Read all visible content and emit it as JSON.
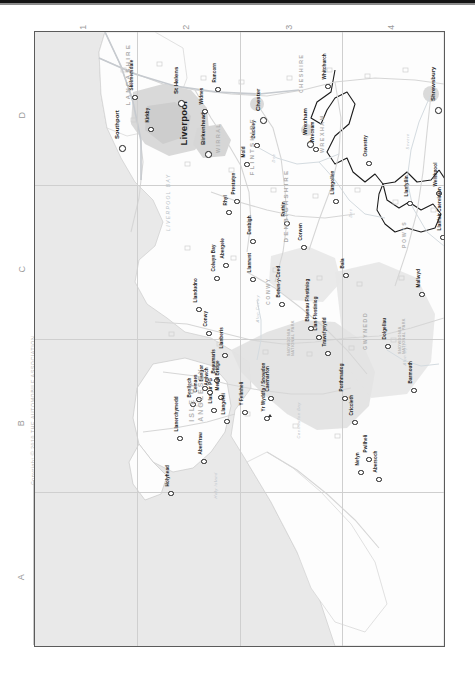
{
  "page": {
    "kind": "road-atlas-page",
    "orientation": "rotated-90-clockwise",
    "copyright": "Copyright © 2010 THE AUTOMOBILE ASSOCIATION",
    "accent_color": "#1d1d1d",
    "sea_color": "#e9e9e9",
    "land_color": "#fdfdfd",
    "county_label_color": "#a9a9a9",
    "water_label_color": "#b9c3c9"
  },
  "grid": {
    "columns": [
      "1",
      "2",
      "3",
      "4"
    ],
    "rows": [
      "D",
      "C",
      "B",
      "A"
    ]
  },
  "cities": [
    {
      "name": "Liverpool",
      "x": 148,
      "y": 108
    }
  ],
  "big_towns": [
    {
      "name": "Southport",
      "x": 82,
      "y": 104
    },
    {
      "name": "St Helens",
      "x": 141,
      "y": 59
    },
    {
      "name": "Birkenhead",
      "x": 168,
      "y": 110
    },
    {
      "name": "Chester",
      "x": 223,
      "y": 76
    },
    {
      "name": "Shrewsbury",
      "x": 398,
      "y": 66
    },
    {
      "name": "Wrexham",
      "x": 270,
      "y": 100
    }
  ],
  "towns": [
    {
      "name": "Skelmersdale",
      "x": 96,
      "y": 56
    },
    {
      "name": "Kirkby",
      "x": 112,
      "y": 88
    },
    {
      "name": "Runcorn",
      "x": 179,
      "y": 48
    },
    {
      "name": "Widnes",
      "x": 166,
      "y": 70
    },
    {
      "name": "Buckley",
      "x": 218,
      "y": 104
    },
    {
      "name": "Mold",
      "x": 208,
      "y": 123
    },
    {
      "name": "Whitchurch",
      "x": 289,
      "y": 45
    },
    {
      "name": "Wrecsam",
      "x": 277,
      "y": 108
    },
    {
      "name": "Oswestry",
      "x": 330,
      "y": 122
    },
    {
      "name": "Llangollen",
      "x": 297,
      "y": 160
    },
    {
      "name": "Welshpool",
      "x": 400,
      "y": 152
    },
    {
      "name": "Llanfyllin",
      "x": 371,
      "y": 162
    },
    {
      "name": "Bishop's Castle",
      "x": 438,
      "y": 165
    },
    {
      "name": "Llanfair Caereinion",
      "x": 404,
      "y": 196
    },
    {
      "name": "Rhyl",
      "x": 190,
      "y": 171
    },
    {
      "name": "Prestatyn",
      "x": 198,
      "y": 160
    },
    {
      "name": "Ruthin",
      "x": 248,
      "y": 182
    },
    {
      "name": "Denbigh",
      "x": 214,
      "y": 200
    },
    {
      "name": "Corwen",
      "x": 265,
      "y": 206
    },
    {
      "name": "Bala",
      "x": 307,
      "y": 234
    },
    {
      "name": "Colwyn Bay",
      "x": 178,
      "y": 237
    },
    {
      "name": "Abergele",
      "x": 187,
      "y": 224
    },
    {
      "name": "Llandudno",
      "x": 160,
      "y": 268
    },
    {
      "name": "Conwy",
      "x": 170,
      "y": 292
    },
    {
      "name": "Llanrwst",
      "x": 214,
      "y": 238
    },
    {
      "name": "Betws-y-Coed",
      "x": 243,
      "y": 263
    },
    {
      "name": "Llanberis",
      "x": 186,
      "y": 314
    },
    {
      "name": "Bangor",
      "x": 166,
      "y": 347
    },
    {
      "name": "Beaumaris",
      "x": 178,
      "y": 339
    },
    {
      "name": "Menai Bridge",
      "x": 182,
      "y": 356
    },
    {
      "name": "Llanfair PG",
      "x": 175,
      "y": 369
    },
    {
      "name": "Amlwch",
      "x": 171,
      "y": 351
    },
    {
      "name": "Cemaes",
      "x": 160,
      "y": 358
    },
    {
      "name": "Llanerchymedd",
      "x": 141,
      "y": 397
    },
    {
      "name": "Benllech",
      "x": 154,
      "y": 363
    },
    {
      "name": "Llangefni",
      "x": 188,
      "y": 380
    },
    {
      "name": "Holyhead",
      "x": 132,
      "y": 452
    },
    {
      "name": "Aberffraw",
      "x": 165,
      "y": 420
    },
    {
      "name": "Caernarfon",
      "x": 232,
      "y": 357
    },
    {
      "name": "Y Felinheli",
      "x": 206,
      "y": 371
    },
    {
      "name": "Yr Wyddfa / Snowdon",
      "x": 228,
      "y": 377
    },
    {
      "name": "Blaenau Ffestiniog",
      "x": 272,
      "y": 287
    },
    {
      "name": "Llan Ffestiniog",
      "x": 280,
      "y": 296
    },
    {
      "name": "Trawsfynydd",
      "x": 289,
      "y": 312
    },
    {
      "name": "Porthmadog",
      "x": 306,
      "y": 357
    },
    {
      "name": "Criccieth",
      "x": 316,
      "y": 381
    },
    {
      "name": "Pwllheli",
      "x": 330,
      "y": 418
    },
    {
      "name": "Nefyn",
      "x": 322,
      "y": 431
    },
    {
      "name": "Abersoch",
      "x": 340,
      "y": 438
    },
    {
      "name": "Dolgellau",
      "x": 349,
      "y": 305
    },
    {
      "name": "Mallwyd",
      "x": 383,
      "y": 253
    },
    {
      "name": "Barmouth",
      "x": 375,
      "y": 349
    },
    {
      "name": "Tywyn",
      "x": 423,
      "y": 358
    }
  ],
  "counties": [
    {
      "name": "LANCASHIRE",
      "x": 92,
      "y": 70
    },
    {
      "name": "WIRRAL",
      "x": 183,
      "y": 118
    },
    {
      "name": "CHESHIRE",
      "x": 266,
      "y": 58
    },
    {
      "name": "SHROPSHIRE",
      "x": 442,
      "y": 90
    },
    {
      "name": "FLINTSHIRE",
      "x": 216,
      "y": 140
    },
    {
      "name": "WREXHAM",
      "x": 287,
      "y": 118
    },
    {
      "name": "DENBIGHSHIRE",
      "x": 250,
      "y": 207
    },
    {
      "name": "CONWY",
      "x": 233,
      "y": 270
    },
    {
      "name": "GWYNEDD",
      "x": 330,
      "y": 315
    },
    {
      "name": "POWYS",
      "x": 369,
      "y": 213
    }
  ],
  "islands": [
    {
      "name": "ISLE OF\nANGLESEY",
      "x": 162,
      "y": 381
    }
  ],
  "parks": [
    {
      "name": "SNOWDONIA\nNATIONAL PARK",
      "x": 256,
      "y": 320
    },
    {
      "name": "SNOWDONIA\nNATIONAL PARK",
      "x": 367,
      "y": 318
    }
  ],
  "water_labels": [
    {
      "name": "LIVERPOOL BAY",
      "x": 133,
      "y": 196
    },
    {
      "name": "Caernarfon Bay",
      "x": 263,
      "y": 404
    },
    {
      "name": "CARDIGAN BAY",
      "x": 425,
      "y": 404
    },
    {
      "name": "Holy Island",
      "x": 180,
      "y": 464
    },
    {
      "name": "Afon Conwy",
      "x": 222,
      "y": 288
    },
    {
      "name": "Afon Dyfi",
      "x": 369,
      "y": 331
    },
    {
      "name": "Dee",
      "x": 238,
      "y": 128
    },
    {
      "name": "Dee",
      "x": 315,
      "y": 183
    },
    {
      "name": "Severn",
      "x": 372,
      "y": 115
    },
    {
      "name": "Severn",
      "x": 437,
      "y": 158
    }
  ],
  "copyright_spine": "Copyright © 2010 THE AUTOMOBILE ASSOCIATION"
}
